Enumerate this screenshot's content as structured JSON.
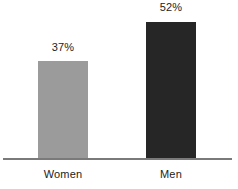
{
  "chart_data": {
    "type": "bar",
    "title": "",
    "subtitle": "",
    "xlabel": "",
    "ylabel": "",
    "categories": [
      "Women",
      "Men"
    ],
    "values": [
      37,
      52
    ],
    "value_labels": [
      "37%",
      "52%"
    ],
    "ylim": [
      0,
      62
    ],
    "grid": false,
    "legend": null,
    "series": [
      {
        "name": "",
        "values": [
          37,
          52
        ]
      }
    ],
    "colors": {
      "women_bar": "#9b9b9b",
      "men_bar": "#262626",
      "axis_line": "#7a7a7a",
      "label_text": "#1c1c1c",
      "background": "#ffffff"
    }
  }
}
